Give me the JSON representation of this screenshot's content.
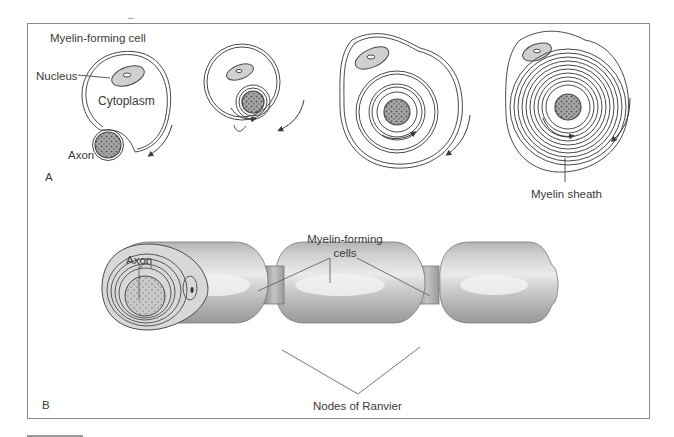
{
  "figure": {
    "panel_a": {
      "panel_label": "A",
      "title": "Myelin-forming cell",
      "labels": {
        "nucleus": "Nucleus",
        "cytoplasm": "Cytoplasm",
        "axon": "Axon",
        "myelin_sheath": "Myelin sheath"
      },
      "stages": 4
    },
    "panel_b": {
      "panel_label": "B",
      "labels": {
        "axon": "Axon",
        "myelin_forming_cells_line1": "Myelin-forming",
        "myelin_forming_cells_line2": "cells",
        "nodes_of_ranvier": "Nodes of  Ranvier"
      }
    },
    "colors": {
      "line": "#4a4a4a",
      "frame": "#8a8a8a",
      "cell_fill": "#c8c8c8",
      "cell_highlight": "#eeeeee",
      "axon_fill": "#9a9a9a"
    }
  }
}
